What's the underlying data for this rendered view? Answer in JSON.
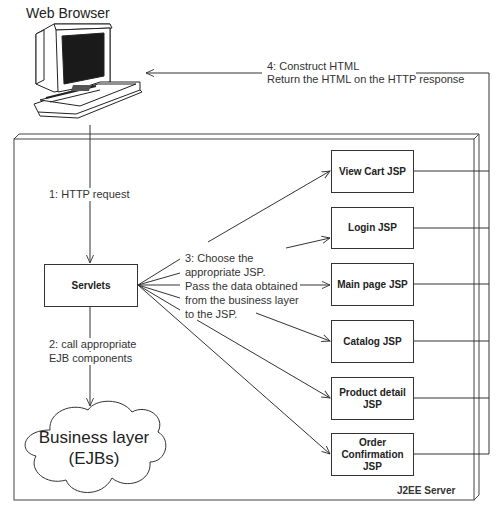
{
  "diagram": {
    "browser_label": "Web Browser",
    "server_label": "J2EE Server",
    "servlets_label": "Servlets",
    "business_layer": {
      "line1": "Business layer",
      "line2": "(EJBs)"
    },
    "steps": {
      "step1": "1: HTTP request",
      "step2": {
        "line1": "2: call appropriate",
        "line2": "EJB components"
      },
      "step3": {
        "line1": "3: Choose the",
        "line2": "appropriate JSP.",
        "line3": "Pass the data obtained",
        "line4": "from the business layer",
        "line5": "to the JSP."
      },
      "step4": {
        "line1": "4: Construct HTML",
        "line2": "Return the HTML on the HTTP response"
      }
    },
    "jsps": [
      {
        "line1": "View Cart JSP"
      },
      {
        "line1": "Login JSP"
      },
      {
        "line1": "Main page JSP"
      },
      {
        "line1": "Catalog JSP"
      },
      {
        "line1": "Product detail",
        "line2": "JSP"
      },
      {
        "line1": "Order",
        "line2": "Confirmation",
        "line3": "JSP"
      }
    ],
    "colors": {
      "line": "#333333",
      "screen": "#1a1a1a",
      "background": "#ffffff"
    }
  }
}
